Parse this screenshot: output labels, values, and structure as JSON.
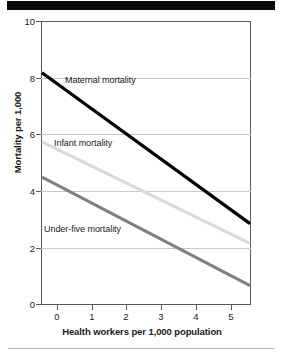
{
  "chart_data": {
    "type": "line",
    "title": "",
    "subtitle": "",
    "xlabel": "Health workers per 1,000 population",
    "ylabel": "Mortality per 1,000",
    "xlim": [
      -0.45,
      5.6
    ],
    "ylim": [
      0,
      10
    ],
    "xticks": [
      "0",
      "1",
      "2",
      "3",
      "4",
      "5"
    ],
    "xtick_values": [
      0,
      1,
      2,
      3,
      4,
      5
    ],
    "yticks": [
      "0",
      "2",
      "4",
      "6",
      "8",
      "10"
    ],
    "ytick_values": [
      0,
      2,
      4,
      6,
      8,
      10
    ],
    "grid": "horizontal",
    "legend_position": "inline-labels",
    "series": [
      {
        "name": "Maternal mortality",
        "color": "#000000",
        "x": [
          -0.45,
          5.6
        ],
        "values": [
          8.2,
          2.85
        ]
      },
      {
        "name": "Infant mortality",
        "color": "#d9d9d9",
        "x": [
          -0.45,
          5.6
        ],
        "values": [
          5.75,
          2.15
        ]
      },
      {
        "name": "Under-five mortality",
        "color": "#808080",
        "x": [
          -0.45,
          5.6
        ],
        "values": [
          4.5,
          0.65
        ]
      }
    ]
  },
  "labels": {
    "maternal": "Maternal mortality",
    "infant": "Infant mortality",
    "underfive": "Under-five mortality"
  },
  "axis": {
    "y_title": "Mortality per 1,000",
    "x_title": "Health workers per 1,000 population",
    "y_t0": "0",
    "y_t1": "2",
    "y_t2": "4",
    "y_t3": "6",
    "y_t4": "8",
    "y_t5": "10",
    "x_t0": "0",
    "x_t1": "1",
    "x_t2": "2",
    "x_t3": "3",
    "x_t4": "4",
    "x_t5": "5"
  }
}
